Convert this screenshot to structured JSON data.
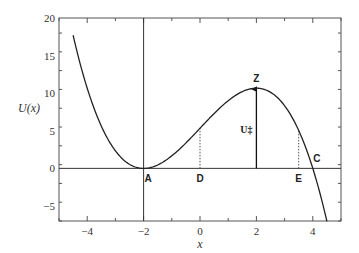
{
  "chart_data": {
    "type": "line",
    "title": "",
    "xlabel": "x",
    "ylabel": "U(x)",
    "xlim": [
      -5,
      5
    ],
    "ylim": [
      -7,
      20
    ],
    "xticks": [
      -4,
      -2,
      0,
      2,
      4
    ],
    "xtick_labels": [
      "−4",
      "−2",
      "0",
      "2",
      "4"
    ],
    "yticks": [
      -5,
      0,
      5,
      10,
      15,
      20
    ],
    "ytick_labels": [
      "−5",
      "0",
      "5",
      "10",
      "15",
      "20"
    ],
    "grid": false,
    "legend": null,
    "series": [
      {
        "name": "U(x)",
        "formula": "-(x+2)^2 (x-4) / 3",
        "x": [
          -4.5,
          -4,
          -3.5,
          -3,
          -2.5,
          -2,
          -1.5,
          -1,
          -0.5,
          0,
          0.5,
          1,
          1.5,
          2,
          2.5,
          3,
          3.5,
          4,
          4.5
        ],
        "values": [
          17.7,
          10.67,
          5.75,
          2.33,
          0.54,
          0,
          0.46,
          1.67,
          3.38,
          5.33,
          7.29,
          9.0,
          10.21,
          10.67,
          10.13,
          8.33,
          5.04,
          0,
          -7.04
        ]
      }
    ],
    "reference_lines": [
      {
        "type": "horizontal",
        "y": 0,
        "style": "solid"
      },
      {
        "type": "vertical",
        "x": -2,
        "style": "solid"
      }
    ],
    "annotations": [
      {
        "label": "A",
        "x": -2,
        "y": 0,
        "note": "minimum"
      },
      {
        "label": "D",
        "x": 0,
        "y": 5.33,
        "note": "dotted drop line"
      },
      {
        "label": "Z",
        "x": 2,
        "y": 10.67,
        "note": "maximum"
      },
      {
        "label": "U‡",
        "x": 2,
        "y": 5.3,
        "note": "arrow from 0 to peak"
      },
      {
        "label": "E",
        "x": 3.5,
        "y": 5.04,
        "note": "dotted drop line"
      },
      {
        "label": "C",
        "x": 4,
        "y": 0,
        "note": "zero crossing"
      }
    ]
  }
}
